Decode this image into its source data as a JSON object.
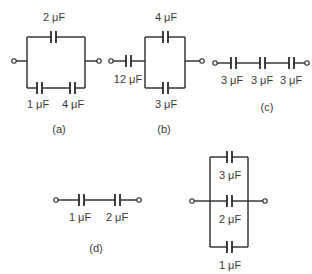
{
  "diagram": {
    "type": "capacitor circuits",
    "circuits": {
      "a": {
        "label": "(a)",
        "caps": [
          "2 μF",
          "1 μF",
          "4 μF"
        ],
        "topology": "2 μF in parallel with (1 μF series 4 μF)"
      },
      "b": {
        "label": "(b)",
        "caps": [
          "12 μF",
          "4 μF",
          "3 μF"
        ],
        "topology": "12 μF in series with (4 μF parallel 3 μF)"
      },
      "c": {
        "label": "(c)",
        "caps": [
          "3 μF",
          "3 μF",
          "3 μF"
        ],
        "topology": "three 3 μF in series"
      },
      "d": {
        "label": "(d)",
        "caps": [
          "1 μF",
          "2 μF"
        ],
        "topology": "1 μF in series with 2 μF"
      },
      "e": {
        "label": "",
        "caps": [
          "3 μF",
          "2 μF",
          "1 μF"
        ],
        "topology": "3 μF, 2 μF, 1 μF in parallel"
      }
    }
  }
}
